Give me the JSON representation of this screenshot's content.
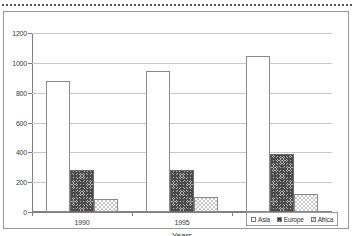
{
  "chart_data": {
    "type": "bar",
    "title": "",
    "subtitle": "",
    "xlabel": "Years",
    "ylabel": "",
    "categories": [
      "1990",
      "1995",
      "1999"
    ],
    "series": [
      {
        "name": "Asia",
        "values": [
          880,
          945,
          1045
        ],
        "fill": "white-empty"
      },
      {
        "name": "Europe",
        "values": [
          285,
          280,
          390
        ],
        "fill": "dark-crosshatch"
      },
      {
        "name": "Africa",
        "values": [
          90,
          100,
          120
        ],
        "fill": "light-checker"
      }
    ],
    "ylim": [
      0,
      1200
    ],
    "yticks": [
      0,
      200,
      400,
      600,
      800,
      1000,
      1200
    ],
    "ytick_labels": [
      "0",
      "200",
      "400",
      "600",
      "800",
      "1000",
      "1200"
    ],
    "grid": true,
    "grid_axis": "y",
    "legend_position": "bottom-right",
    "bar_grouping": "clustered"
  },
  "legend": {
    "entries": [
      {
        "label": "Asia",
        "swatch": "legend-swatch-asia"
      },
      {
        "label": "Europe",
        "swatch": "legend-swatch-europe"
      },
      {
        "label": "Africa",
        "swatch": "legend-swatch-africa"
      }
    ]
  },
  "decoration": {
    "top_rule": "dotted-separator"
  }
}
